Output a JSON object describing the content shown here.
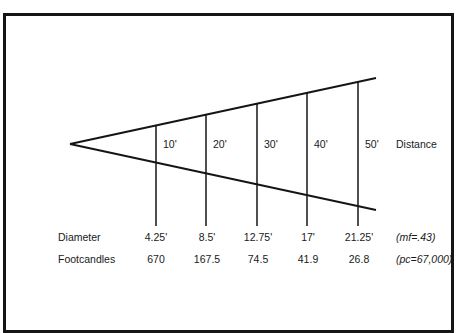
{
  "diagram": {
    "title": "",
    "colors": {
      "line": "#151515",
      "text": "#1a1a1a",
      "background": "#ffffff"
    },
    "apex": {
      "x": 70,
      "y": 144
    },
    "upper_line_end": {
      "x": 376,
      "y": 78
    },
    "lower_line_end": {
      "x": 376,
      "y": 210
    },
    "distance_axis_label": "Distance",
    "row_labels": {
      "diameter": "Diameter",
      "footcandles": "Footcandles"
    },
    "annotations": {
      "mf": "(mf=.43)",
      "pc": "(pc=67,000)"
    },
    "stations": [
      {
        "distance": "10'",
        "diameter": "4.25'",
        "footcandles": "670",
        "x": 156
      },
      {
        "distance": "20'",
        "diameter": "8.5'",
        "footcandles": "167.5",
        "x": 206
      },
      {
        "distance": "30'",
        "diameter": "12.75'",
        "footcandles": "74.5",
        "x": 257
      },
      {
        "distance": "40'",
        "diameter": "17'",
        "footcandles": "41.9",
        "x": 307
      },
      {
        "distance": "50'",
        "diameter": "21.25'",
        "footcandles": "26.8",
        "x": 358
      }
    ]
  }
}
